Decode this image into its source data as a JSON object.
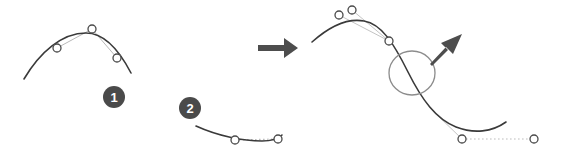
{
  "figure": {
    "background_color": "#ffffff",
    "width": 571,
    "height": 161
  },
  "colors": {
    "curve_stroke": "#3a3a3a",
    "handle_line": "#b9b9b9",
    "dotted_handle": "#bdbdbd",
    "node_stroke": "#4a4a4a",
    "node_fill": "#ffffff",
    "badge_fill": "#4a4a4a",
    "badge_text": "#ffffff",
    "arrow_fill": "#4d4d4d",
    "highlight_circle": "#8c8c8c"
  },
  "badges": [
    {
      "label": "1",
      "cx": 114,
      "cy": 97,
      "r": 11
    },
    {
      "label": "2",
      "cx": 190,
      "cy": 108,
      "r": 11
    }
  ],
  "panels": {
    "left_top": {
      "name": "curve-segment-one",
      "curve_path": "M 24,79 C 40,52 62,33 86,33 C 104,33 118,48 131,73",
      "nodes": [
        {
          "name": "anchor-left",
          "cx": 57,
          "cy": 48
        },
        {
          "name": "control-top",
          "cx": 92,
          "cy": 29
        },
        {
          "name": "anchor-right",
          "cx": 117,
          "cy": 58
        }
      ],
      "handles": [
        {
          "x1": 57,
          "y1": 48,
          "x2": 92,
          "y2": 29
        },
        {
          "x1": 92,
          "y1": 29,
          "x2": 117,
          "y2": 58
        }
      ]
    },
    "left_bottom": {
      "name": "curve-segment-two",
      "curve_path": "M 196,126 C 218,136 243,141 262,141 C 272,141 278,139 282,135",
      "nodes": [
        {
          "name": "anchor-left",
          "cx": 235,
          "cy": 140
        },
        {
          "name": "anchor-right",
          "cx": 278,
          "cy": 139
        }
      ],
      "dotted_handle": {
        "x1": 235,
        "y1": 140,
        "x2": 278,
        "y2": 139
      }
    },
    "transition_arrow": {
      "name": "right-arrow",
      "path": "M 258,45 L 284,45 L 284,39 L 297,48 L 284,57 L 284,51 L 258,51 Z"
    },
    "right": {
      "name": "merged-curve",
      "curve_path": "M 312,42 C 330,26 348,18 364,21 C 382,24 394,44 408,72 C 422,100 436,119 456,127 C 474,134 492,132 506,122",
      "nodes": [
        {
          "name": "control-upper-left",
          "cx": 339,
          "cy": 15
        },
        {
          "name": "control-upper-right",
          "cx": 352,
          "cy": 10
        },
        {
          "name": "anchor-mid-upper",
          "cx": 389,
          "cy": 41
        },
        {
          "name": "anchor-lower-left",
          "cx": 462,
          "cy": 139
        },
        {
          "name": "anchor-lower-right",
          "cx": 534,
          "cy": 139
        }
      ],
      "handles": [
        {
          "x1": 339,
          "y1": 15,
          "x2": 389,
          "y2": 41
        },
        {
          "x1": 352,
          "y1": 10,
          "x2": 389,
          "y2": 41
        },
        {
          "x1": 432,
          "y1": 110,
          "x2": 462,
          "y2": 139
        }
      ],
      "dotted_handle": {
        "x1": 462,
        "y1": 139,
        "x2": 534,
        "y2": 139
      },
      "highlight_circle": {
        "cx": 412,
        "cy": 73,
        "rx": 23,
        "ry": 22
      },
      "pointer_arrow": {
        "name": "down-left-arrow",
        "path": "M 431,62 L 446,48 L 453,55 L 461,36 L 441,44 L 448,51 L 433,65 Z"
      }
    }
  }
}
